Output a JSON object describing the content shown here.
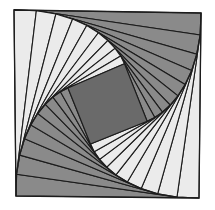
{
  "figure": {
    "type": "geometric-pattern",
    "background_color": "#ffffff",
    "outline_color": "#1c1c1c",
    "canvas": {
      "width": 215,
      "height": 210
    }
  },
  "palette": {
    "gray": "#8a8a8a",
    "light": "#ebebeb",
    "dark_center": "#6a6a6a",
    "outline": "#1c1c1c",
    "background": "#ffffff"
  },
  "chart_data": {
    "type": "pie",
    "xlabel": "",
    "ylabel": "",
    "categories": [
      "gray-quadrants",
      "light-quadrants",
      "dark-center"
    ],
    "values": [
      2,
      2,
      1
    ],
    "ring_count": 9,
    "rotation_step_degrees": 7.5,
    "scale_step": 0.885,
    "outer_square": {
      "top_left": [
        14,
        10
      ],
      "top_right": [
        201,
        13
      ],
      "bottom_right": [
        199,
        198
      ],
      "bottom_left": [
        16,
        196
      ]
    },
    "rings": [
      {
        "index": 0,
        "scale": 1.0,
        "rotation": 0.0,
        "quadrant_fills": [
          "gray",
          "light",
          "gray",
          "light"
        ]
      },
      {
        "index": 1,
        "scale": 0.885,
        "rotation": 7.5,
        "quadrant_fills": [
          "gray",
          "light",
          "gray",
          "light"
        ]
      },
      {
        "index": 2,
        "scale": 0.783,
        "rotation": 15.0,
        "quadrant_fills": [
          "gray",
          "light",
          "gray",
          "light"
        ]
      },
      {
        "index": 3,
        "scale": 0.693,
        "rotation": 22.5,
        "quadrant_fills": [
          "gray",
          "light",
          "gray",
          "light"
        ]
      },
      {
        "index": 4,
        "scale": 0.613,
        "rotation": 30.0,
        "quadrant_fills": [
          "gray",
          "light",
          "gray",
          "light"
        ]
      },
      {
        "index": 5,
        "scale": 0.543,
        "rotation": 37.5,
        "quadrant_fills": [
          "gray",
          "light",
          "gray",
          "light"
        ]
      },
      {
        "index": 6,
        "scale": 0.48,
        "rotation": 45.0,
        "quadrant_fills": [
          "gray",
          "light",
          "gray",
          "light"
        ]
      },
      {
        "index": 7,
        "scale": 0.425,
        "rotation": 52.5,
        "quadrant_fills": [
          "gray",
          "light",
          "gray",
          "light"
        ]
      },
      {
        "index": 8,
        "scale": 0.376,
        "rotation": 60.0,
        "quadrant_fills": [
          "gray",
          "light",
          "gray",
          "light"
        ]
      }
    ],
    "center": {
      "fill": "dark_center",
      "rotation": 67.5,
      "scale": 0.33
    },
    "legend": [],
    "grid": false
  }
}
